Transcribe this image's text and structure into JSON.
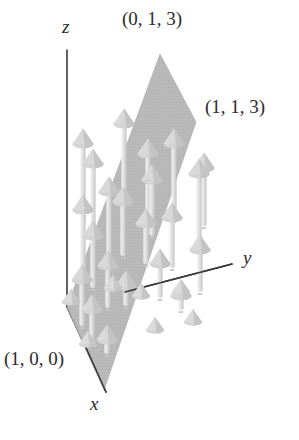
{
  "figure": {
    "title": "",
    "background_color": "#ffffff",
    "axis_color": "#3a3a3a",
    "plane_color": "#b9b9b9",
    "plane_edge_color": "#a8a8a8",
    "arrow_color": "#d9d9d9",
    "arrow_shade_color": "#ededed",
    "arrow_dark_color": "#bdbdbd",
    "label_color": "#2b2b2b"
  },
  "labels": {
    "point_top": "(0, 1, 3)",
    "point_right": "(1, 1, 3)",
    "point_bottom_left": "(1, 0, 0)",
    "axis_x": "x",
    "axis_y": "y",
    "axis_z": "z"
  },
  "chart_data": {
    "type": "scatter",
    "title": "",
    "xlabel": "x",
    "ylabel": "y",
    "zlabel": "z",
    "axes": [
      {
        "name": "z",
        "label": "z",
        "from_px": [
          67,
          307
        ],
        "to_px": [
          67,
          50
        ]
      },
      {
        "name": "y",
        "label": "y",
        "from_px": [
          67,
          307
        ],
        "to_px": [
          232,
          264
        ]
      },
      {
        "name": "x",
        "label": "x",
        "from_px": [
          67,
          307
        ],
        "to_px": [
          106,
          392
        ]
      }
    ],
    "annotated_points": [
      {
        "label": "(0, 1, 3)",
        "coords": [
          0,
          1,
          3
        ],
        "px": [
          160,
          54
        ]
      },
      {
        "label": "(1, 1, 3)",
        "coords": [
          1,
          1,
          3
        ],
        "px": [
          196,
          122
        ]
      },
      {
        "label": "(1, 0, 0)",
        "coords": [
          1,
          0,
          0
        ],
        "px": [
          84,
          330
        ]
      }
    ],
    "plane": {
      "vertices_coords": [
        [
          0,
          0,
          0
        ],
        [
          1,
          0,
          0
        ],
        [
          1,
          1,
          3
        ],
        [
          0,
          1,
          3
        ]
      ],
      "vertices_px": [
        [
          67,
          307
        ],
        [
          104,
          390
        ],
        [
          196,
          122
        ],
        [
          160,
          54
        ]
      ],
      "fill": "#b9b9b9",
      "opacity": 1
    },
    "grid": false,
    "legend": null,
    "vectors": [
      {
        "px": [
          83,
          130
        ],
        "length_px": 96
      },
      {
        "px": [
          83,
          196
        ],
        "length_px": 76
      },
      {
        "px": [
          82,
          266
        ],
        "length_px": 62
      },
      {
        "px": [
          93,
          150
        ],
        "length_px": 86
      },
      {
        "px": [
          93,
          222
        ],
        "length_px": 68
      },
      {
        "px": [
          92,
          296
        ],
        "length_px": 44
      },
      {
        "px": [
          109,
          178
        ],
        "length_px": 78
      },
      {
        "px": [
          108,
          252
        ],
        "length_px": 58
      },
      {
        "px": [
          107,
          326
        ],
        "length_px": 30
      },
      {
        "px": [
          124,
          110
        ],
        "length_px": 100
      },
      {
        "px": [
          123,
          188
        ],
        "length_px": 70
      },
      {
        "px": [
          126,
          272
        ],
        "length_px": 36
      },
      {
        "px": [
          148,
          140
        ],
        "length_px": 84
      },
      {
        "px": [
          146,
          210
        ],
        "length_px": 56
      },
      {
        "px": [
          152,
          166
        ],
        "length_px": 72
      },
      {
        "px": [
          160,
          250
        ],
        "length_px": 50
      },
      {
        "px": [
          174,
          130
        ],
        "length_px": 92
      },
      {
        "px": [
          172,
          204
        ],
        "length_px": 66
      },
      {
        "px": [
          181,
          282
        ],
        "length_px": 30
      },
      {
        "px": [
          199,
          160
        ],
        "length_px": 82
      },
      {
        "px": [
          200,
          236
        ],
        "length_px": 58
      },
      {
        "px": [
          204,
          154
        ],
        "length_px": 74
      }
    ],
    "zero_cones": [
      {
        "px": [
          71,
          302
        ]
      },
      {
        "px": [
          88,
          344
        ]
      },
      {
        "px": [
          113,
          288
        ]
      },
      {
        "px": [
          141,
          296
        ]
      },
      {
        "px": [
          181,
          292
        ]
      },
      {
        "px": [
          155,
          330
        ]
      },
      {
        "px": [
          193,
          322
        ]
      }
    ]
  }
}
